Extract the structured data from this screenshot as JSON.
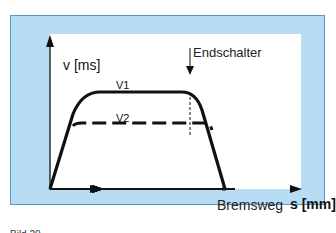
{
  "diagram": {
    "y_axis_label": "v [ms]",
    "x_axis_label_text": "Bremsweg",
    "x_axis_label_unit": "s [mm]",
    "curve_labels": {
      "v1": "V1",
      "v2": "V2"
    },
    "marker_label": "Endschalter",
    "colors": {
      "background": "#b7dcf3",
      "border": "#4f9ad2",
      "panel": "#ffffff",
      "lines": "#111111"
    }
  },
  "caption": "Bild 20"
}
